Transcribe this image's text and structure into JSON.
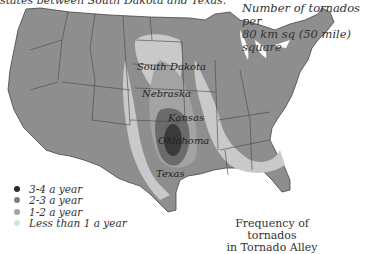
{
  "header": {
    "cropped_top_text": "states between South Dakota and Texas.",
    "subtitle_line1": "Number of tornados per",
    "subtitle_line2": "80 km sq (50 mile) square"
  },
  "map": {
    "state_labels": [
      {
        "name": "South Dakota"
      },
      {
        "name": "Nebraska"
      },
      {
        "name": "Kansas"
      },
      {
        "name": "Oklahoma"
      },
      {
        "name": "Texas"
      }
    ]
  },
  "legend": {
    "items": [
      {
        "label": "3-4 a year",
        "color": "#2b2b2b"
      },
      {
        "label": "2-3 a year",
        "color": "#7d7d7d"
      },
      {
        "label": "1-2 a year",
        "color": "#a3a3a3"
      },
      {
        "label": "Less than 1 a year",
        "color": "#dedede"
      }
    ]
  },
  "caption": {
    "line1": "Frequency of tornados",
    "line2": "in Tornado Alley"
  },
  "colors": {
    "base_state": "#8e8e8e",
    "low": "#c9c9c9",
    "mid": "#a3a3a3",
    "high": "#6b6b6b",
    "peak": "#3a3a3a",
    "border": "#444444"
  }
}
